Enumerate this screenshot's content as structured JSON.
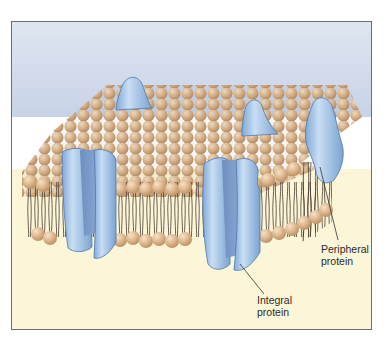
{
  "diagram": {
    "labels": {
      "peripheral": {
        "line1": "Peripheral",
        "line2": "protein"
      },
      "integral": {
        "line1": "Integral",
        "line2": "protein"
      }
    },
    "colors": {
      "sky_top": "#b9c7e0",
      "sky_bottom": "#dfe6f1",
      "white_band": "#ffffff",
      "cream": "#fbf6d8",
      "lipid_head": "#d9b48a",
      "lipid_head_highlight": "#f3dcc0",
      "lipid_tail": "#4a3a2e",
      "protein": "#8fb9e2",
      "protein_light": "#c6dcf2",
      "protein_dark": "#6f93c4",
      "frame_border": "#6e6e6e"
    }
  }
}
